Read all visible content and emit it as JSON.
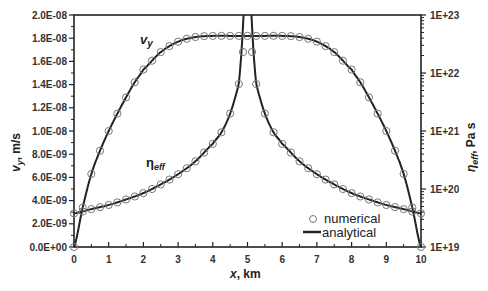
{
  "chart_data": {
    "type": "line",
    "title": "",
    "xlabel": "x, km",
    "ylabel_left": "v_y, m/s",
    "ylabel_right": "η_eff, Pa s",
    "xlim": [
      0,
      10
    ],
    "ylim_left": [
      0,
      2e-08
    ],
    "ylim_right_log": [
      1e+19,
      1e+23
    ],
    "x_ticks": [
      "0",
      "1",
      "2",
      "3",
      "4",
      "5",
      "6",
      "7",
      "8",
      "9",
      "10"
    ],
    "y_ticks_left": [
      "0.0E+00",
      "2.0E-09",
      "4.0E-09",
      "6.0E-09",
      "8.0E-09",
      "1.0E-08",
      "1.2E-08",
      "1.4E-08",
      "1.6E-08",
      "1.8E-08",
      "2.0E-08"
    ],
    "y_ticks_right": [
      "1E+19",
      "1E+20",
      "1E+21",
      "1E+22",
      "1E+23"
    ],
    "legend": [
      {
        "label": "numerical",
        "marker": "circle"
      },
      {
        "label": "analytical",
        "marker": "line"
      }
    ],
    "legend_position": "lower right",
    "annotations": [
      "v_y",
      "η_eff"
    ],
    "series": [
      {
        "name": "v_y",
        "axis": "left",
        "x": [
          0,
          0.25,
          0.5,
          0.75,
          1.0,
          1.25,
          1.5,
          1.75,
          2.0,
          2.5,
          3.0,
          3.5,
          4.0,
          4.5,
          5.0,
          5.5,
          6.0,
          6.5,
          7.0,
          7.5,
          8.0,
          8.25,
          8.5,
          8.75,
          9.0,
          9.25,
          9.5,
          9.75,
          10.0
        ],
        "values": [
          0,
          3.4e-09,
          6.3e-09,
          8.3e-09,
          1e-08,
          1.15e-08,
          1.29e-08,
          1.42e-08,
          1.53e-08,
          1.68e-08,
          1.77e-08,
          1.81e-08,
          1.82e-08,
          1.82e-08,
          1.82e-08,
          1.82e-08,
          1.82e-08,
          1.81e-08,
          1.77e-08,
          1.68e-08,
          1.53e-08,
          1.42e-08,
          1.29e-08,
          1.15e-08,
          1e-08,
          8.3e-09,
          6.3e-09,
          3.4e-09,
          0
        ]
      },
      {
        "name": "η_eff",
        "axis": "right",
        "x": [
          0,
          0.5,
          1.0,
          1.5,
          2.0,
          2.5,
          3.0,
          3.5,
          4.0,
          4.25,
          4.5,
          4.75,
          4.9,
          5.1,
          5.25,
          5.5,
          5.75,
          6.0,
          6.5,
          7.0,
          7.5,
          8.0,
          8.5,
          9.0,
          9.5,
          10.0
        ],
        "values": [
          3.8e+19,
          4.5e+19,
          5.3e+19,
          6.6e+19,
          8.5e+19,
          1.2e+20,
          1.8e+20,
          3e+20,
          6e+20,
          9.5e+20,
          2e+21,
          6.5e+21,
          3e+22,
          3e+22,
          6.5e+21,
          2e+21,
          9.5e+20,
          6e+20,
          3e+20,
          1.8e+20,
          1.2e+20,
          8.5e+19,
          6.6e+19,
          5.3e+19,
          4.5e+19,
          3.8e+19
        ]
      }
    ]
  },
  "labels": {
    "vy_annotation": "v",
    "vy_annotation_sub": "y",
    "eta_annotation": "η",
    "eta_annotation_sub": "eff",
    "xlabel_var": "x",
    "xlabel_unit": ", km",
    "ylabel_left_var": "v",
    "ylabel_left_sub": "y",
    "ylabel_left_unit": ", m/s",
    "ylabel_right_var": "η",
    "ylabel_right_sub": "eff",
    "ylabel_right_unit": ", Pa s"
  }
}
